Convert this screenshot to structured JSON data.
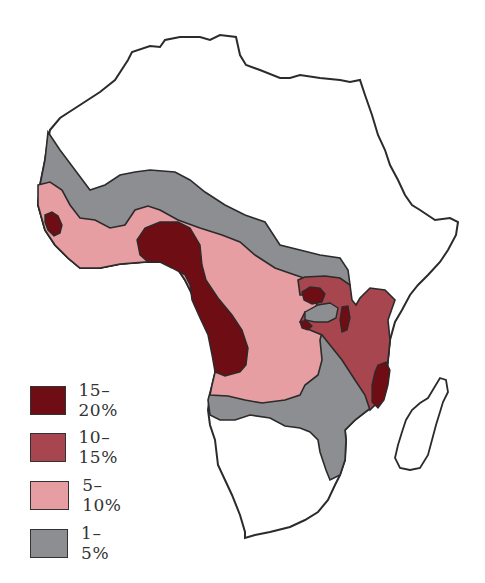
{
  "map": {
    "region": "Africa",
    "colors": {
      "outline": "#2b2b2b",
      "land": "#ffffff",
      "level_15_20": "#6e0d14",
      "level_10_15": "#a8464f",
      "level_5_10": "#e79ea2",
      "level_1_5": "#8c8e91"
    }
  },
  "legend": {
    "items": [
      {
        "label": "15–20%",
        "color": "#6e0d14"
      },
      {
        "label": "10–15%",
        "color": "#a8464f"
      },
      {
        "label": "5–10%",
        "color": "#e79ea2"
      },
      {
        "label": "1–5%",
        "color": "#8c8e91"
      }
    ]
  }
}
